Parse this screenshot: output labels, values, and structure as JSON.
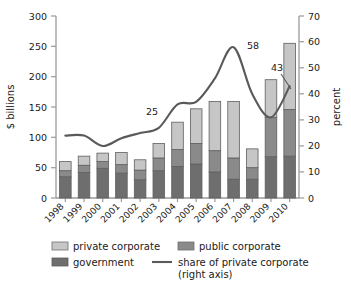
{
  "chart_data": {
    "type": "bar",
    "subtype": "stacked-bar-with-line-overlay",
    "title": "",
    "xlabel": "",
    "ylabel": "$ billions",
    "y2label": "percent",
    "ylim": [
      0,
      300
    ],
    "y2lim": [
      0,
      70
    ],
    "yticks": [
      0,
      50,
      100,
      150,
      200,
      250,
      300
    ],
    "y2ticks": [
      0,
      10,
      20,
      30,
      40,
      50,
      60,
      70
    ],
    "grid": false,
    "legend_position": "bottom",
    "categories": [
      "1998",
      "1999",
      "2000",
      "2001",
      "2002",
      "2003",
      "2004",
      "2005",
      "2006",
      "2007",
      "2008",
      "2009",
      "2010"
    ],
    "series": [
      {
        "name": "government",
        "axis": "left",
        "color": "#6e6e6e",
        "values": [
          35,
          42,
          49,
          41,
          30,
          45,
          52,
          56,
          43,
          31,
          31,
          68,
          69
        ]
      },
      {
        "name": "public corporate",
        "axis": "left",
        "color": "#8a8a8a",
        "values": [
          10,
          12,
          11,
          14,
          16,
          21,
          28,
          34,
          35,
          35,
          19,
          65,
          77
        ]
      },
      {
        "name": "private corporate",
        "axis": "left",
        "color": "#c6c6c6",
        "values": [
          15,
          15,
          14,
          20,
          17,
          24,
          45,
          57,
          81,
          93,
          31,
          62,
          109
        ]
      },
      {
        "name": "share of private corporate (right axis)",
        "axis": "right",
        "type": "line",
        "color": "#5a5a5a",
        "values": [
          24,
          24,
          20,
          23,
          25,
          27,
          36,
          37,
          46,
          58,
          40,
          31,
          43
        ]
      }
    ],
    "stack_totals": [
      60,
      69,
      74,
      75,
      63,
      90,
      125,
      147,
      159,
      159,
      81,
      195,
      255
    ],
    "annotations": [
      {
        "text": "25",
        "series": "share of private corporate (right axis)",
        "x": "2002",
        "value": 25
      },
      {
        "text": "58",
        "series": "share of private corporate (right axis)",
        "x": "2007",
        "value": 58
      },
      {
        "text": "43",
        "series": "share of private corporate (right axis)",
        "x": "2010",
        "value": 43
      }
    ]
  },
  "axes": {
    "left_title": "$ billions",
    "right_title": "percent",
    "left_ticks": [
      "0",
      "50",
      "100",
      "150",
      "200",
      "250",
      "300"
    ],
    "right_ticks": [
      "0",
      "10",
      "20",
      "30",
      "40",
      "50",
      "60",
      "70"
    ],
    "year_ticks": [
      "1998",
      "1999",
      "2000",
      "2001",
      "2002",
      "2003",
      "2004",
      "2005",
      "2006",
      "2007",
      "2008",
      "2009",
      "2010"
    ]
  },
  "annotations": {
    "a25": "25",
    "a58": "58",
    "a43": "43"
  },
  "legend": {
    "items": [
      {
        "label": "private corporate",
        "color": "#c6c6c6",
        "kind": "swatch"
      },
      {
        "label": "public corporate",
        "color": "#8a8a8a",
        "kind": "swatch"
      },
      {
        "label": "government",
        "color": "#6e6e6e",
        "kind": "swatch"
      },
      {
        "label": "share of private corporate",
        "sublabel": "(right axis)",
        "color": "#5a5a5a",
        "kind": "line"
      }
    ]
  },
  "colors": {
    "private_corporate": "#c6c6c6",
    "public_corporate": "#8a8a8a",
    "government": "#6e6e6e",
    "line": "#5a5a5a",
    "axis": "#9a9a9a",
    "text": "#1a1a1a"
  }
}
